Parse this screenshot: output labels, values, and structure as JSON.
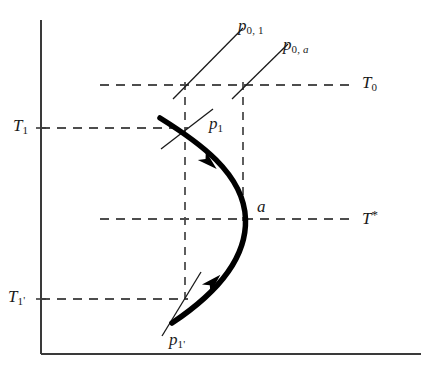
{
  "figure": {
    "type": "thermodynamic-phase-diagram",
    "background_color": "#ffffff",
    "line_color": "#1a1a1a",
    "axis_color": "#3a3a3a",
    "dash_color": "#4d4d4d",
    "curve_color": "#000000",
    "axes": {
      "y_axis_name": "vertical-axis",
      "x_axis_name": "horizontal-axis",
      "y_axis_x": 41,
      "y_axis_top": 20,
      "y_axis_bottom": 354,
      "x_axis_y": 354,
      "x_axis_left": 41,
      "x_axis_right": 421
    },
    "isotherms": [
      {
        "id": "T0",
        "base": "T",
        "sub": "0",
        "label_text": "T0",
        "y": 85,
        "x_start": 100,
        "x_end": 353,
        "label_x": 362,
        "label_y": 76
      },
      {
        "id": "T1",
        "base": "T",
        "sub": "1",
        "label_text": "T1",
        "y": 128,
        "x_start": 41,
        "x_end": 188,
        "label_x": 14,
        "label_y": 119
      },
      {
        "id": "Tstar",
        "base": "T",
        "sup": "*",
        "label_text": "T*",
        "y": 219,
        "x_start": 100,
        "x_end": 353,
        "label_x": 362,
        "label_y": 210
      },
      {
        "id": "T1prime",
        "base": "T",
        "sub": "1",
        "prime": "'",
        "label_text": "T1'",
        "y": 299,
        "x_start": 41,
        "x_end": 188,
        "label_x": 10,
        "label_y": 290
      }
    ],
    "verticals": [
      {
        "id": "v-left",
        "x": 185,
        "y_top": 85,
        "y_bottom": 299
      },
      {
        "id": "v-right",
        "x": 243,
        "y_top": 85,
        "y_bottom": 219
      }
    ],
    "curve": {
      "name": "spinodal-curve",
      "stroke_width": 5.5,
      "path": "M 160,118 C 196,140 243,172 245,219 C 247,264 205,300 173,323"
    },
    "arrows": [
      {
        "id": "arrow-upper",
        "x": 208,
        "y": 161,
        "angle": 44
      },
      {
        "id": "arrow-lower",
        "x": 213,
        "y": 282,
        "angle": -42
      }
    ],
    "tangents": [
      {
        "id": "tangent-p1",
        "x1": 162,
        "y1": 148,
        "x2": 212,
        "y2": 110
      },
      {
        "id": "tangent-p1prime",
        "x1": 163,
        "y1": 334,
        "x2": 200,
        "y2": 273
      },
      {
        "id": "tangent-p0-1",
        "x1": 173,
        "y1": 99,
        "x2": 243,
        "y2": 28
      },
      {
        "id": "tangent-p0-a",
        "x1": 232,
        "y1": 99,
        "x2": 288,
        "y2": 44
      }
    ],
    "point_labels": [
      {
        "id": "p0-1",
        "base": "p",
        "sub": "0, 1",
        "label_text": "p0, 1",
        "x": 240,
        "y": 19
      },
      {
        "id": "p0-a",
        "base": "p",
        "sub_pre": "0, ",
        "sub_italic": "a",
        "label_text": "p0, a",
        "x": 284,
        "y": 38
      },
      {
        "id": "p1",
        "base": "p",
        "sub": "1",
        "label_text": "p1",
        "x": 208,
        "y": 117
      },
      {
        "id": "p1-prime",
        "base": "p",
        "sub": "1'",
        "label_text": "p1'",
        "x": 170,
        "y": 333
      },
      {
        "id": "point-a",
        "base": "a",
        "label_text": "a",
        "x": 256,
        "y": 199
      }
    ],
    "tick_marks": [
      {
        "id": "tick-T1-axis",
        "x": 41,
        "y": 128
      },
      {
        "id": "tick-T1prime-axis",
        "x": 41,
        "y": 299
      }
    ]
  }
}
